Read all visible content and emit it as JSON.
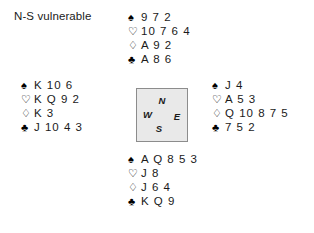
{
  "header": {
    "vulnerability": "N-S vulnerable"
  },
  "suits": {
    "spade": "♠",
    "heart": "♡",
    "diamond": "♢",
    "club": "♣"
  },
  "compass": {
    "north": "N",
    "south": "S",
    "east": "E",
    "west": "W"
  },
  "hands": {
    "north": {
      "spades": "9 7 2",
      "hearts": "10 7 6 4",
      "diamonds": "A 9 2",
      "clubs": "A 8 6"
    },
    "west": {
      "spades": "K 10 6",
      "hearts": "K Q 9 2",
      "diamonds": "K 3",
      "clubs": "J 10 4 3"
    },
    "east": {
      "spades": "J 4",
      "hearts": "A 5 3",
      "diamonds": "Q 10 8 7 5",
      "clubs": "7 5 2"
    },
    "south": {
      "spades": "A Q 8 5 3",
      "hearts": "J 8",
      "diamonds": "J 6 4",
      "clubs": "K Q 9"
    }
  },
  "colors": {
    "background": "#ffffff",
    "text": "#1a1a1a",
    "compass_fill": "#e9e9e9",
    "compass_border": "#8c8c8c"
  }
}
